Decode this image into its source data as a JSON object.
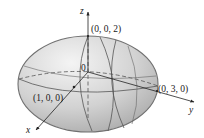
{
  "figure": {
    "type": "ellipsoid-3d-sketch",
    "surface": "ellipsoid",
    "semi_axes": {
      "x": 1,
      "y": 3,
      "z": 2
    },
    "colors": {
      "fill_light": "#f1f1f1",
      "fill_dark": "#a9a9a9",
      "outline": "#707070",
      "grid_line": "#555555",
      "axis": "#222222",
      "text": "#1a1a1a"
    }
  },
  "axes": {
    "x_label": "x",
    "y_label": "y",
    "z_label": "z"
  },
  "labels": {
    "origin": "0",
    "point_x": "(1, 0, 0)",
    "point_y": "(0, 3, 0)",
    "point_z": "(0, 0, 2)"
  }
}
